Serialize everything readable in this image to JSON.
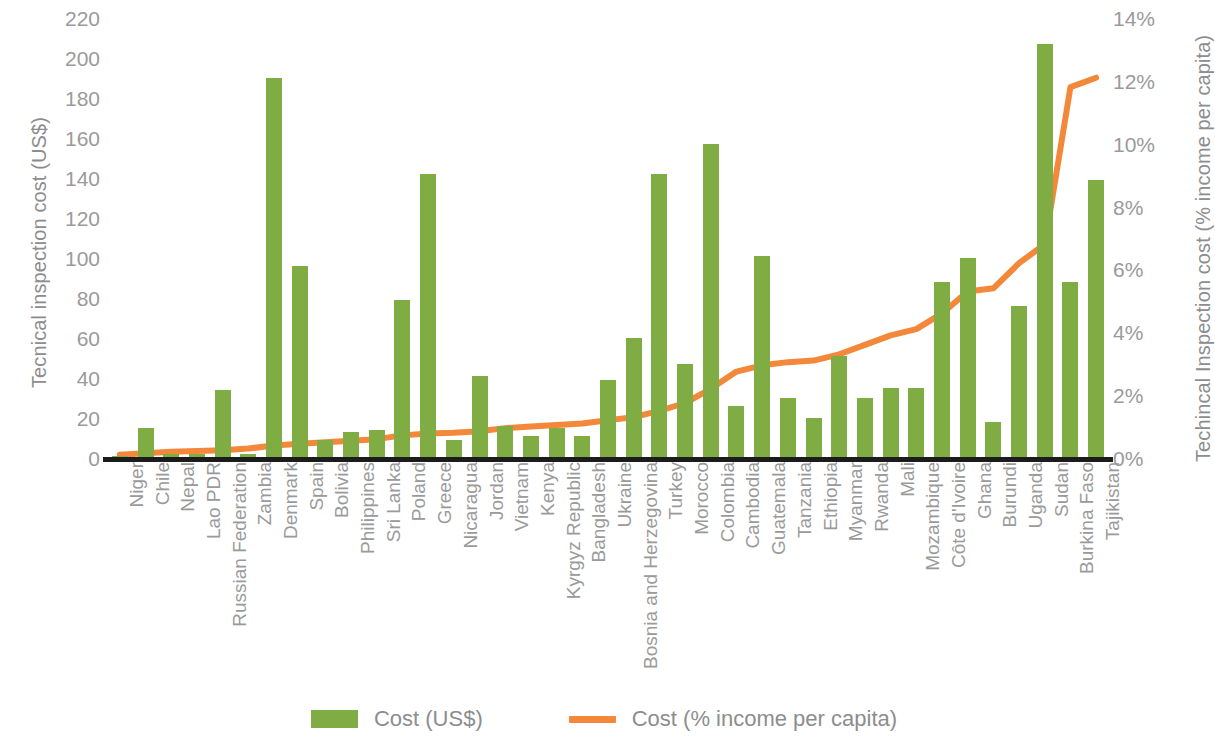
{
  "chart_data": {
    "type": "bar",
    "title": "",
    "subtitle": "",
    "xlabel": "",
    "ylabel": "Tecnical inspection cost (US$)",
    "y2label": "Techincal Inspection cost (% income per capita)",
    "ylim": [
      0,
      220
    ],
    "y2lim": [
      0,
      14
    ],
    "grid": false,
    "legend_position": "bottom-center",
    "y_ticks": [
      "0",
      "20",
      "40",
      "60",
      "80",
      "100",
      "120",
      "140",
      "160",
      "180",
      "200",
      "220"
    ],
    "y_tick_values": [
      0,
      20,
      40,
      60,
      80,
      100,
      120,
      140,
      160,
      180,
      200,
      220
    ],
    "y2_ticks": [
      "0%",
      "2%",
      "4%",
      "6%",
      "8%",
      "10%",
      "12%",
      "14%"
    ],
    "y2_tick_values": [
      0,
      2,
      4,
      6,
      8,
      10,
      12,
      14
    ],
    "categories": [
      "Niger",
      "Chile",
      "Nepal",
      "Lao PDR",
      "Russian Federation",
      "Zambia",
      "Denmark",
      "Spain",
      "Bolivia",
      "Philippines",
      "Sri Lanka",
      "Poland",
      "Greece",
      "Nicaragua",
      "Jordan",
      "Vietnam",
      "Kenya",
      "Kyrgyz Republic",
      "Bangladesh",
      "Ukraine",
      "Bosnia and Herzegovina",
      "Turkey",
      "Morocco",
      "Colombia",
      "Cambodia",
      "Guatemala",
      "Tanzania",
      "Ethiopia",
      "Myanmar",
      "Rwanda",
      "Mali",
      "Mozambique",
      "Côte d'Ivoire",
      "Ghana",
      "Burundi",
      "Uganda",
      "Sudan",
      "Burkina Faso",
      "Tajikistan"
    ],
    "series": [
      {
        "name": "Cost (US$)",
        "type": "bar",
        "axis": "left",
        "color": "#7FAC43",
        "values": [
          1,
          15,
          2,
          2,
          34,
          2,
          190,
          96,
          9,
          13,
          14,
          79,
          142,
          9,
          41,
          16,
          11,
          15,
          11,
          39,
          60,
          142,
          47,
          157,
          26,
          101,
          30,
          20,
          51,
          30,
          35,
          35,
          88,
          100,
          18,
          76,
          207,
          88,
          139
        ]
      },
      {
        "name": "Cost (% income per capita)",
        "type": "line",
        "axis": "right",
        "color": "#F4883A",
        "values": [
          0.1,
          0.15,
          0.2,
          0.22,
          0.25,
          0.3,
          0.4,
          0.45,
          0.5,
          0.55,
          0.6,
          0.72,
          0.78,
          0.8,
          0.85,
          0.95,
          1.0,
          1.05,
          1.1,
          1.2,
          1.3,
          1.5,
          1.75,
          2.2,
          2.75,
          2.95,
          3.05,
          3.1,
          3.3,
          3.6,
          3.9,
          4.1,
          4.6,
          5.3,
          5.4,
          6.2,
          6.8,
          11.8,
          12.1
        ]
      }
    ]
  },
  "legend": {
    "items": [
      {
        "label": "Cost (US$)",
        "marker": "bar-swatch",
        "color": "#7FAC43"
      },
      {
        "label": "Cost (% income per capita)",
        "marker": "line-swatch",
        "color": "#F4883A"
      }
    ]
  },
  "colors": {
    "bar": "#7FAC43",
    "line": "#F4883A",
    "axis": "#1C1C1C",
    "text": "#9A9A9A"
  }
}
